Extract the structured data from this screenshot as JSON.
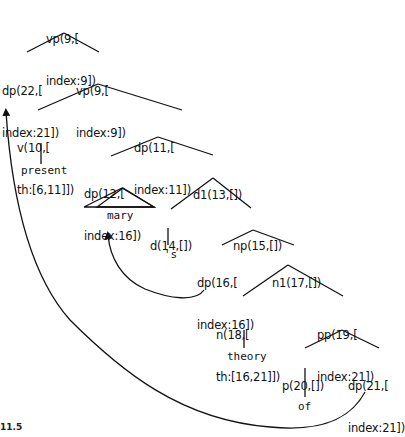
{
  "figure_label": "11.5",
  "nodes": {
    "n_vp9_top": {
      "line1": "vp(9,[",
      "line2": "index:9])"
    },
    "n_dp22": {
      "line1": "dp(22,[",
      "line2": "index:21])"
    },
    "n_vp9": {
      "line1": "vp(9,[",
      "line2": "index:9])"
    },
    "n_v10": {
      "line1": "v(10,[",
      "line2": "th:[6,11]])"
    },
    "n_dp11": {
      "line1": "dp(11,[",
      "line2": "index:11])"
    },
    "n_dp12": {
      "line1": "dp(12,[",
      "line2": "index:16])"
    },
    "n_d1_13": {
      "line1": "d1(13,[])"
    },
    "n_d14": {
      "line1": "d(14,[])"
    },
    "n_np15": {
      "line1": "np(15,[])"
    },
    "n_dp16": {
      "line1": "dp(16,[",
      "line2": "index:16])"
    },
    "n_n1_17": {
      "line1": "n1(17,[])"
    },
    "n_n18": {
      "line1": "n(18,[",
      "line2": "th:[16,21]])"
    },
    "n_pp19": {
      "line1": "pp(19,[",
      "line2": "index:21])"
    },
    "n_p20": {
      "line1": "p(20,[])"
    },
    "n_dp21": {
      "line1": "dp(21,[",
      "line2": "index:21])"
    }
  },
  "leaves": {
    "present": "present",
    "mary": "mary",
    "s": "'s",
    "theory": "theory",
    "of": "of"
  },
  "movement_arrows": [
    {
      "from": "dp(21,[index:21])",
      "to": "dp(22,[index:21])"
    },
    {
      "from": "dp(16,[index:16])",
      "to": "dp(12,[index:16])"
    }
  ]
}
